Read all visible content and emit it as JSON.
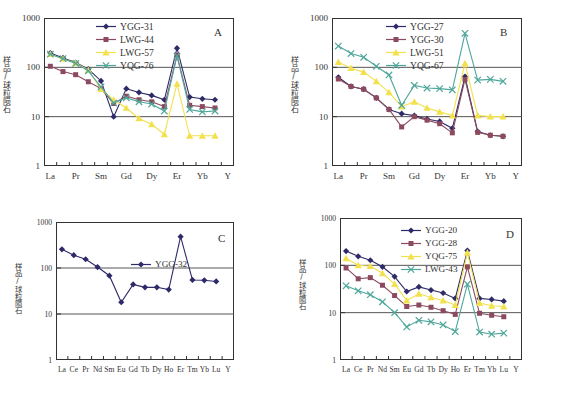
{
  "figure": {
    "y_axis_label": "样品/球粒陨石",
    "y_ticks": [
      "1",
      "10",
      "100",
      "1000"
    ],
    "y_range": [
      1,
      1000
    ]
  },
  "colors": {
    "navy": "#2e2a68",
    "maroon": "#8c4a5e",
    "yellow": "#f2e14c",
    "teal": "#4fa79b",
    "axis": "#333333",
    "gridline": "#555555",
    "background": "#ffffff"
  },
  "panels": [
    {
      "letter": "A",
      "x_tick_labels": [
        "La",
        "Pr",
        "Sm",
        "Gd",
        "Dy",
        "Er",
        "Yb",
        "Y"
      ],
      "x_tick_indices": [
        0,
        2,
        4,
        6,
        8,
        10,
        12,
        14
      ],
      "legend": [
        "YGG-31",
        "LWG-44",
        "LWG-57",
        "YQG-76"
      ]
    },
    {
      "letter": "B",
      "x_tick_labels": [
        "La",
        "Pr",
        "Sm",
        "Gd",
        "Dy",
        "Er",
        "Yb",
        "Y"
      ],
      "x_tick_indices": [
        0,
        2,
        4,
        6,
        8,
        10,
        12,
        14
      ],
      "legend": [
        "YGG-27",
        "YGG-30",
        "LWG-51",
        "YQG-67"
      ]
    },
    {
      "letter": "C",
      "x_tick_labels": [
        "La",
        "Ce",
        "Pr",
        "Nd",
        "Sm",
        "Eu",
        "Gd",
        "Tb",
        "Dy",
        "Ho",
        "Er",
        "Tm",
        "Yb",
        "Lu",
        "Y"
      ],
      "x_tick_indices": [
        0,
        1,
        2,
        3,
        4,
        5,
        6,
        7,
        8,
        9,
        10,
        11,
        12,
        13,
        14
      ],
      "legend": [
        "YGG-32"
      ]
    },
    {
      "letter": "D",
      "x_tick_labels": [
        "La",
        "Ce",
        "Pr",
        "Nd",
        "Sm",
        "Eu",
        "Gd",
        "Tb",
        "Dy",
        "Ho",
        "Er",
        "Tm",
        "Yb",
        "Lu",
        "Y"
      ],
      "x_tick_indices": [
        0,
        1,
        2,
        3,
        4,
        5,
        6,
        7,
        8,
        9,
        10,
        11,
        12,
        13,
        14
      ],
      "legend": [
        "YGG-20",
        "YGG-28",
        "YQG-75",
        "LWG-43"
      ]
    }
  ],
  "chart_data": [
    {
      "panel": "A",
      "type": "line",
      "title": "A",
      "xlabel": "",
      "ylabel": "样品/球粒陨石",
      "log_y": true,
      "ylim": [
        1,
        1000
      ],
      "grid": true,
      "legend_position": "top-center",
      "categories": [
        "La",
        "Ce",
        "Pr",
        "Nd",
        "Sm",
        "Eu",
        "Gd",
        "Tb",
        "Dy",
        "Ho",
        "Er",
        "Tm",
        "Yb",
        "Lu",
        "Y"
      ],
      "series": [
        {
          "name": "YGG-31",
          "color": "#2e2a68",
          "marker": "diamond",
          "values": [
            195,
            155,
            125,
            92,
            53,
            10,
            37,
            31,
            27,
            22,
            245,
            25,
            23,
            22,
            null
          ]
        },
        {
          "name": "LWG-44",
          "color": "#8c4a5e",
          "marker": "square",
          "values": [
            105,
            82,
            71,
            51,
            37,
            18.5,
            26,
            22,
            20,
            16,
            175,
            17,
            16,
            15,
            null
          ]
        },
        {
          "name": "LWG-57",
          "color": "#f2e14c",
          "marker": "triangle",
          "values": [
            185,
            148,
            122,
            88,
            36,
            22,
            15,
            9.2,
            7,
            4.4,
            46,
            4.1,
            4.1,
            4.1,
            null
          ]
        },
        {
          "name": "YQG-76",
          "color": "#4fa79b",
          "marker": "x",
          "values": [
            185,
            150,
            120,
            85,
            40,
            19,
            24,
            20,
            18,
            13,
            170,
            14,
            12.5,
            13,
            null
          ]
        }
      ]
    },
    {
      "panel": "B",
      "type": "line",
      "title": "B",
      "xlabel": "",
      "ylabel": "样品/球粒陨石",
      "log_y": true,
      "ylim": [
        1,
        1000
      ],
      "grid": true,
      "legend_position": "top-center",
      "categories": [
        "La",
        "Ce",
        "Pr",
        "Nd",
        "Sm",
        "Eu",
        "Gd",
        "Tb",
        "Dy",
        "Ho",
        "Er",
        "Tm",
        "Yb",
        "Lu",
        "Y"
      ],
      "series": [
        {
          "name": "YGG-27",
          "color": "#2e2a68",
          "marker": "diamond",
          "values": [
            63,
            41,
            36,
            24,
            14,
            11.5,
            10.5,
            9,
            8,
            5.8,
            65,
            5,
            4.2,
            4,
            null
          ]
        },
        {
          "name": "YGG-30",
          "color": "#8c4a5e",
          "marker": "square",
          "values": [
            58,
            41,
            36,
            24,
            14,
            6.2,
            10,
            8.5,
            7.2,
            4.7,
            57,
            4.8,
            4.2,
            4,
            null
          ]
        },
        {
          "name": "LWG-51",
          "color": "#f2e14c",
          "marker": "triangle",
          "values": [
            128,
            96,
            80,
            52,
            31,
            16,
            20,
            15,
            12.5,
            10.5,
            120,
            10.5,
            10,
            10,
            null
          ]
        },
        {
          "name": "YQG-67",
          "color": "#4fa79b",
          "marker": "x",
          "values": [
            270,
            190,
            160,
            105,
            70,
            17,
            43,
            38,
            37,
            35,
            490,
            55,
            57,
            52,
            null
          ]
        }
      ]
    },
    {
      "panel": "C",
      "type": "line",
      "title": "C",
      "xlabel": "",
      "ylabel": "样品/球粒陨石",
      "log_y": true,
      "ylim": [
        1,
        1000
      ],
      "grid": true,
      "legend_position": "top-center",
      "categories": [
        "La",
        "Ce",
        "Pr",
        "Nd",
        "Sm",
        "Eu",
        "Gd",
        "Tb",
        "Dy",
        "Ho",
        "Er",
        "Tm",
        "Yb",
        "Lu",
        "Y"
      ],
      "series": [
        {
          "name": "YGG-32",
          "color": "#2e2a68",
          "marker": "diamond",
          "values": [
            255,
            190,
            155,
            105,
            68,
            18,
            44,
            38,
            38,
            34,
            480,
            55,
            54,
            51,
            null
          ]
        }
      ]
    },
    {
      "panel": "D",
      "type": "line",
      "title": "D",
      "xlabel": "",
      "ylabel": "样品/球粒陨石",
      "log_y": true,
      "ylim": [
        1,
        1000
      ],
      "grid": true,
      "legend_position": "top-center",
      "categories": [
        "La",
        "Ce",
        "Pr",
        "Nd",
        "Sm",
        "Eu",
        "Gd",
        "Tb",
        "Dy",
        "Ho",
        "Er",
        "Tm",
        "Yb",
        "Lu",
        "Y"
      ],
      "series": [
        {
          "name": "YGG-20",
          "color": "#2e2a68",
          "marker": "diamond",
          "values": [
            200,
            155,
            128,
            93,
            58,
            28,
            35,
            30,
            26,
            20,
            205,
            20,
            19,
            17.5,
            null
          ]
        },
        {
          "name": "YGG-28",
          "color": "#8c4a5e",
          "marker": "square",
          "values": [
            88,
            52,
            55,
            38,
            23,
            13.5,
            14.5,
            13,
            11,
            9.2,
            93,
            9.7,
            8.8,
            8.2,
            null
          ]
        },
        {
          "name": "YQG-75",
          "color": "#f2e14c",
          "marker": "triangle",
          "values": [
            140,
            100,
            96,
            68,
            40,
            18,
            25,
            21,
            18,
            14.5,
            185,
            16,
            14,
            13.5,
            null
          ]
        },
        {
          "name": "LWG-43",
          "color": "#4fa79b",
          "marker": "x",
          "values": [
            37,
            29,
            24,
            17,
            10,
            5,
            6.9,
            6.4,
            5.5,
            4,
            40,
            3.9,
            3.5,
            3.7,
            null
          ]
        }
      ]
    }
  ]
}
